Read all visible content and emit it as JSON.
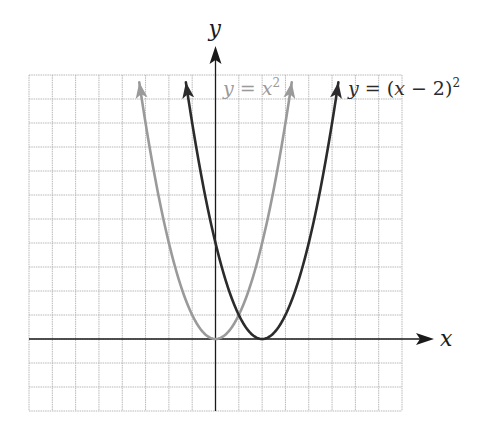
{
  "chart_data": {
    "type": "line",
    "title": "",
    "xlabel": "x",
    "ylabel": "y",
    "xlim": [
      -8,
      8
    ],
    "ylim": [
      -3,
      11
    ],
    "grid": true,
    "tick_labels": false,
    "series": [
      {
        "name": "y = x^2",
        "label_parts": [
          "y",
          " = ",
          "x",
          "2"
        ],
        "color": "#9a9a9a",
        "vertex": [
          0,
          0
        ],
        "shift": 0,
        "x_range": [
          -3.27,
          3.27
        ],
        "arrows": "both",
        "label_position": "top-center"
      },
      {
        "name": "y = (x - 2)^2",
        "label_parts": [
          "y",
          " = (",
          "x",
          " − 2)",
          "2"
        ],
        "color": "#2b2b2b",
        "vertex": [
          2,
          0
        ],
        "shift": 2,
        "x_range": [
          -1.27,
          5.27
        ],
        "arrows": "both",
        "label_position": "top-right"
      }
    ],
    "annotations": [
      {
        "text": "y = x^2",
        "near": "right branch of gray parabola"
      },
      {
        "text": "y = (x - 2)^2",
        "near": "right branch of dark parabola"
      }
    ]
  }
}
